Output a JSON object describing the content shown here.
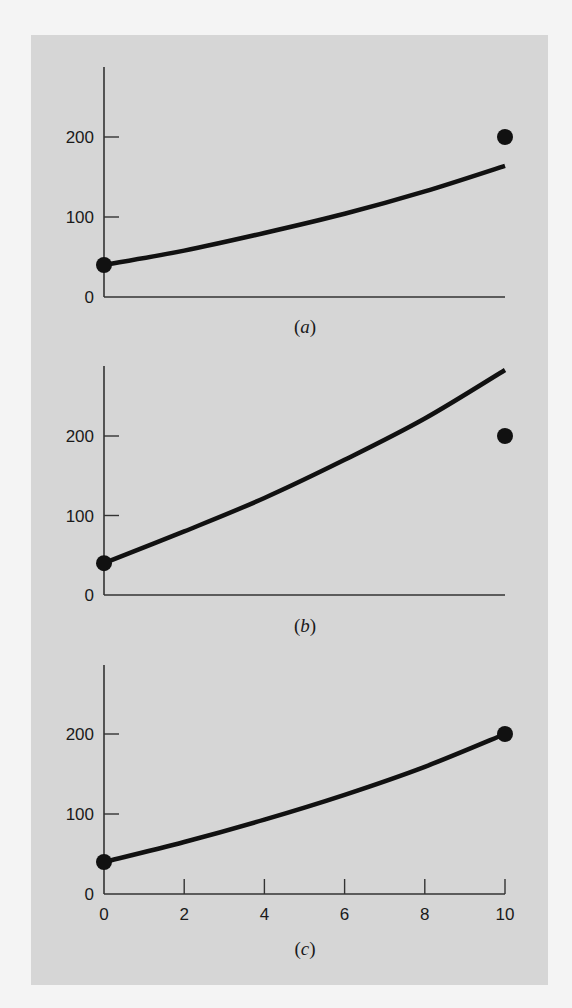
{
  "figure": {
    "background": "#d6d6d6",
    "ink": "#111111"
  },
  "chart_data": [
    {
      "type": "line",
      "panel_label": "a",
      "caption": "(a)",
      "title": "",
      "xlabel": "",
      "ylabel": "",
      "xlim": [
        0,
        10
      ],
      "ylim": [
        0,
        280
      ],
      "yticks": [
        0,
        100,
        200
      ],
      "ytick_labels": [
        "0",
        "100",
        "200"
      ],
      "xticks": [],
      "grid": false,
      "series": [
        {
          "name": "curve",
          "kind": "line",
          "x": [
            0,
            2,
            4,
            6,
            8,
            10
          ],
          "y": [
            40,
            58,
            80,
            104,
            132,
            164
          ]
        },
        {
          "name": "points",
          "kind": "scatter",
          "x": [
            0,
            10
          ],
          "y": [
            40,
            200
          ]
        }
      ]
    },
    {
      "type": "line",
      "panel_label": "b",
      "caption": "(b)",
      "title": "",
      "xlabel": "",
      "ylabel": "",
      "xlim": [
        0,
        10
      ],
      "ylim": [
        0,
        280
      ],
      "yticks": [
        0,
        100,
        200
      ],
      "ytick_labels": [
        "0",
        "100",
        "200"
      ],
      "xticks": [],
      "grid": false,
      "series": [
        {
          "name": "curve",
          "kind": "line",
          "x": [
            0,
            2,
            4,
            6,
            8,
            10
          ],
          "y": [
            40,
            80,
            122,
            170,
            222,
            283
          ]
        },
        {
          "name": "points",
          "kind": "scatter",
          "x": [
            0,
            10
          ],
          "y": [
            40,
            200
          ]
        }
      ]
    },
    {
      "type": "line",
      "panel_label": "c",
      "caption": "(c)",
      "title": "",
      "xlabel": "",
      "ylabel": "",
      "xlim": [
        0,
        10
      ],
      "ylim": [
        0,
        280
      ],
      "yticks": [
        0,
        100,
        200
      ],
      "ytick_labels": [
        "0",
        "100",
        "200"
      ],
      "xticks": [
        0,
        2,
        4,
        6,
        8,
        10
      ],
      "xtick_labels": [
        "0",
        "2",
        "4",
        "6",
        "8",
        "10"
      ],
      "grid": false,
      "series": [
        {
          "name": "curve",
          "kind": "line",
          "x": [
            0,
            2,
            4,
            6,
            8,
            10
          ],
          "y": [
            40,
            65,
            93,
            124,
            159,
            200
          ]
        },
        {
          "name": "points",
          "kind": "scatter",
          "x": [
            0,
            10
          ],
          "y": [
            40,
            200
          ]
        }
      ]
    }
  ]
}
